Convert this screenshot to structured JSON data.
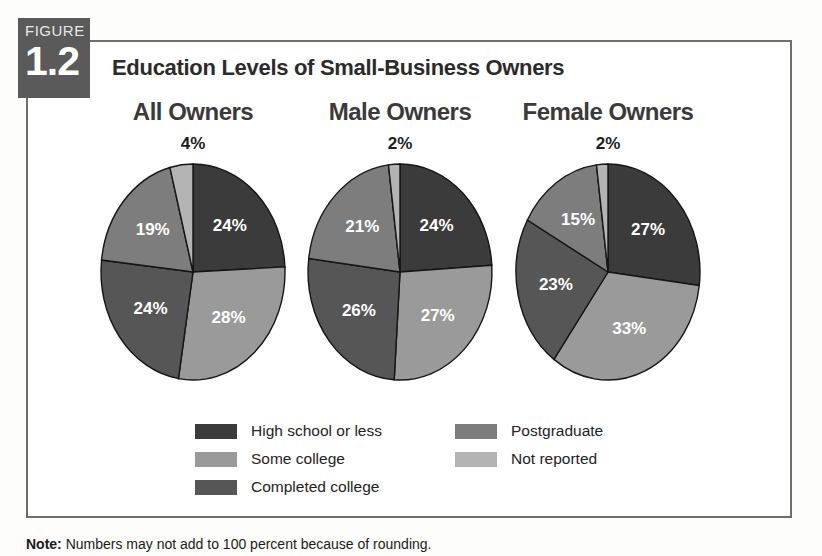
{
  "figure": {
    "badge_word": "FIGURE",
    "badge_number": "1.2",
    "title": "Education Levels of Small-Business Owners",
    "note_label": "Note:",
    "note_text": " Numbers may not add to 100 percent because of rounding."
  },
  "colors": {
    "high_school": "#3b3b3b",
    "some_college": "#9a9a9a",
    "completed_college": "#565656",
    "postgraduate": "#7d7d7d",
    "not_reported": "#b4b4b4",
    "badge_bg": "#5a5a5a",
    "frame_border": "#6e6e6e",
    "page_bg": "#fdfdfb"
  },
  "legend": {
    "columns": [
      [
        {
          "label": "High school or less",
          "key": "high_school"
        },
        {
          "label": "Some college",
          "key": "some_college"
        },
        {
          "label": "Completed college",
          "key": "completed_college"
        }
      ],
      [
        {
          "label": "Postgraduate",
          "key": "postgraduate"
        },
        {
          "label": "Not reported",
          "key": "not_reported"
        }
      ]
    ]
  },
  "chart_data": {
    "type": "pie",
    "title": "Education Levels of Small-Business Owners",
    "subtitle": "",
    "xlabel": "",
    "ylabel": "",
    "units": "percent",
    "legend_position": "bottom",
    "grid": false,
    "categories": [
      "High school or less",
      "Some college",
      "Completed college",
      "Postgraduate",
      "Not reported"
    ],
    "category_colors": [
      "#3b3b3b",
      "#9a9a9a",
      "#565656",
      "#7d7d7d",
      "#b4b4b4"
    ],
    "charts": [
      {
        "title": "All Owners",
        "callout": "4%",
        "callout_category": "Not reported",
        "slices": [
          {
            "category": "High school or less",
            "value": 24,
            "label": "24%",
            "color": "#3b3b3b",
            "label_shown": true
          },
          {
            "category": "Some college",
            "value": 28,
            "label": "28%",
            "color": "#9a9a9a",
            "label_shown": true
          },
          {
            "category": "Completed college",
            "value": 24,
            "label": "24%",
            "color": "#565656",
            "label_shown": true
          },
          {
            "category": "Postgraduate",
            "value": 19,
            "label": "19%",
            "color": "#7d7d7d",
            "label_shown": true
          },
          {
            "category": "Not reported",
            "value": 4,
            "label": "4%",
            "color": "#b4b4b4",
            "label_shown": false
          }
        ]
      },
      {
        "title": "Male Owners",
        "callout": "2%",
        "callout_category": "Not reported",
        "slices": [
          {
            "category": "High school or less",
            "value": 24,
            "label": "24%",
            "color": "#3b3b3b",
            "label_shown": true
          },
          {
            "category": "Some college",
            "value": 27,
            "label": "27%",
            "color": "#9a9a9a",
            "label_shown": true
          },
          {
            "category": "Completed college",
            "value": 26,
            "label": "26%",
            "color": "#565656",
            "label_shown": true
          },
          {
            "category": "Postgraduate",
            "value": 21,
            "label": "21%",
            "color": "#7d7d7d",
            "label_shown": true
          },
          {
            "category": "Not reported",
            "value": 2,
            "label": "2%",
            "color": "#b4b4b4",
            "label_shown": false
          }
        ]
      },
      {
        "title": "Female Owners",
        "callout": "2%",
        "callout_category": "Not reported",
        "slices": [
          {
            "category": "High school or less",
            "value": 27,
            "label": "27%",
            "color": "#3b3b3b",
            "label_shown": true
          },
          {
            "category": "Some college",
            "value": 33,
            "label": "33%",
            "color": "#9a9a9a",
            "label_shown": true
          },
          {
            "category": "Completed college",
            "value": 23,
            "label": "23%",
            "color": "#565656",
            "label_shown": true
          },
          {
            "category": "Postgraduate",
            "value": 15,
            "label": "15%",
            "color": "#7d7d7d",
            "label_shown": true
          },
          {
            "category": "Not reported",
            "value": 2,
            "label": "2%",
            "color": "#b4b4b4",
            "label_shown": false
          }
        ]
      }
    ]
  }
}
